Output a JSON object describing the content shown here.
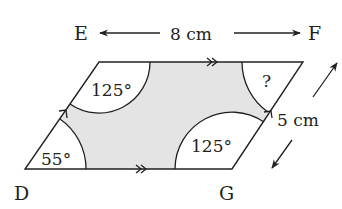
{
  "diagram": {
    "type": "parallelogram-with-angle-sectors",
    "vertices": {
      "bottom_left": "D",
      "bottom_right": "G",
      "top_left_label": "E",
      "top_right_label": "F"
    },
    "dimensions": {
      "top_length": "8 cm",
      "side_length": "5 cm"
    },
    "angles": {
      "bottom_left": "55°",
      "top_left": "125°",
      "bottom_right": "125°",
      "top_right": "?"
    },
    "labels": {
      "E": "E",
      "F": "F",
      "D": "D",
      "G": "G",
      "width": "8 cm",
      "height": "5 cm"
    },
    "colors": {
      "line": "#231f20",
      "shaded_region": "#e4e4e4",
      "background": "#ffffff"
    }
  }
}
